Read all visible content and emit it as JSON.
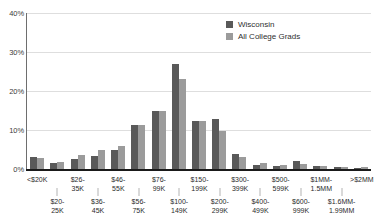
{
  "chart_data": {
    "type": "bar",
    "title": "",
    "xlabel": "",
    "ylabel": "",
    "ylim": [
      0,
      40
    ],
    "ytick_labels": [
      "40%",
      "30%",
      "20%",
      "10%",
      "0%"
    ],
    "ytick_values": [
      40,
      30,
      20,
      10,
      0
    ],
    "grid": true,
    "legend_position": "top-right",
    "categories": [
      "<$20K",
      "$20-\n25K",
      "$26-\n35K",
      "$36-\n45K",
      "$46-\n55K",
      "$56-\n75K",
      "$76-\n99K",
      "$100-\n149K",
      "$150-\n199K",
      "$200-\n299K",
      "$300-\n399K",
      "$400-\n499K",
      "$500-\n599K",
      "$600-\n999K",
      "$1MM-\n1.5MM",
      "$1.6MM-\n1.99MM",
      ">$2MM"
    ],
    "series": [
      {
        "name": "Wisconsin",
        "color": "#595959",
        "values": [
          3.0,
          1.6,
          2.6,
          3.3,
          4.8,
          11.4,
          14.9,
          26.8,
          12.2,
          12.7,
          3.8,
          1.0,
          0.9,
          2.1,
          0.9,
          0.5,
          0.3
        ]
      },
      {
        "name": "All College Grads",
        "color": "#9b9b9b",
        "values": [
          2.9,
          1.7,
          3.5,
          5.0,
          6.0,
          11.4,
          14.8,
          23.1,
          12.4,
          9.8,
          3.2,
          1.5,
          1.1,
          1.2,
          0.7,
          0.4,
          0.4
        ]
      }
    ]
  },
  "legend": {
    "items": [
      {
        "label": "Wisconsin"
      },
      {
        "label": "All College Grads"
      }
    ]
  }
}
